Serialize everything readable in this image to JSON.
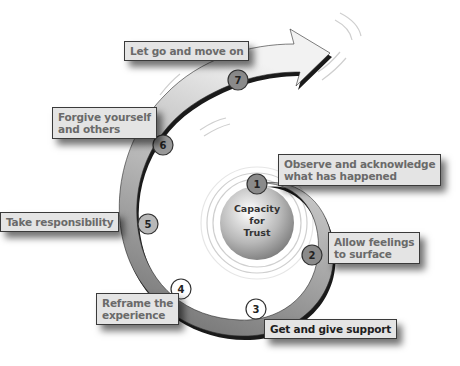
{
  "diagram": {
    "center": {
      "lines": [
        "Capacity",
        "for",
        "Trust"
      ]
    },
    "steps": [
      {
        "number": "1",
        "label_lines": [
          "Observe and acknowledge",
          "what has happened"
        ]
      },
      {
        "number": "2",
        "label_lines": [
          "Allow feelings",
          "to surface"
        ]
      },
      {
        "number": "3",
        "label_lines": [
          "Get and give support"
        ]
      },
      {
        "number": "4",
        "label_lines": [
          "Reframe the",
          "experience"
        ]
      },
      {
        "number": "5",
        "label_lines": [
          "Take responsibility"
        ]
      },
      {
        "number": "6",
        "label_lines": [
          "Forgive yourself",
          "and others"
        ]
      },
      {
        "number": "7",
        "label_lines": [
          "Let go and move on"
        ]
      }
    ],
    "colors": {
      "spiral_start": "#555555",
      "spiral_end": "#f0f0f0",
      "step_circle": "#8a8a8a",
      "label_bg": "#e4e4e4",
      "label_text": "#6a6a6a"
    }
  }
}
